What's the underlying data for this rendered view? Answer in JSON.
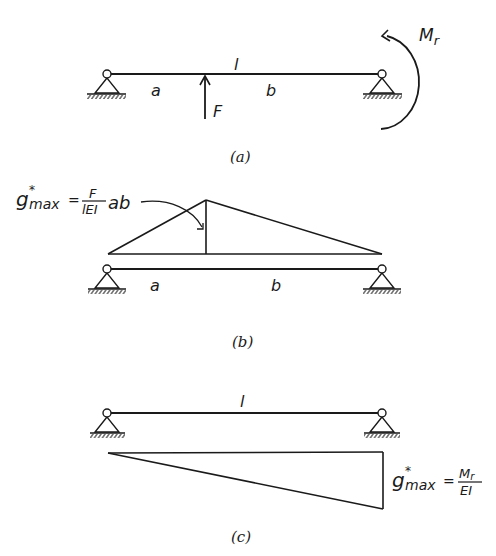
{
  "panels": [
    {
      "id": "a",
      "caption": "(a)",
      "labels": {
        "span": "l",
        "left_segment": "a",
        "right_segment": "b",
        "force": "F",
        "moment": "M",
        "moment_sub": "r"
      }
    },
    {
      "id": "b",
      "caption": "(b)",
      "labels": {
        "left_segment": "a",
        "right_segment": "b"
      },
      "formula": {
        "symbol": "g",
        "star": "*",
        "sub": "max",
        "equals": "=",
        "numerator": "F",
        "denominator": "lEI",
        "suffix": "ab"
      }
    },
    {
      "id": "c",
      "caption": "(c)",
      "labels": {
        "span": "l"
      },
      "formula": {
        "symbol": "g",
        "star": "*",
        "sub": "max",
        "equals": "=",
        "numerator_main": "M",
        "numerator_sub": "r",
        "denominator": "EI"
      }
    }
  ],
  "colors": {
    "ink": "#1a1a1a",
    "background": "#ffffff"
  }
}
